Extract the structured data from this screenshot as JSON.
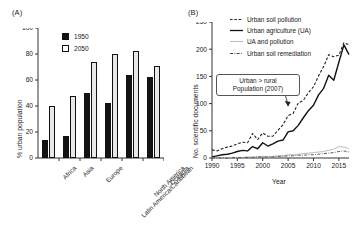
{
  "figure": {
    "panel_a_label": "(A)",
    "panel_b_label": "(B)"
  },
  "chart_data": [
    {
      "type": "bar",
      "panel": "(A)",
      "title": "",
      "xlabel": "",
      "ylabel": "% urban population",
      "ylim": [
        0,
        100
      ],
      "yticks": [
        0,
        20,
        40,
        60,
        80,
        100
      ],
      "grid": false,
      "legend_position": "top-left-inside",
      "categories": [
        "Africa",
        "Asia",
        "Europe",
        "Latin America/Caribbean",
        "North America",
        "Oceania"
      ],
      "series": [
        {
          "name": "1950",
          "color": "#131313",
          "values": [
            14,
            17,
            50,
            42,
            64,
            62
          ]
        },
        {
          "name": "2050",
          "color": "#e8e8e8",
          "values": [
            40,
            48,
            74,
            80,
            82,
            71
          ]
        }
      ]
    },
    {
      "type": "line",
      "panel": "(B)",
      "title": "",
      "xlabel": "Year",
      "ylabel": "No. scientific documents",
      "xlim": [
        1990,
        2017
      ],
      "ylim": [
        0,
        250
      ],
      "yticks": [
        0,
        50,
        100,
        150,
        200,
        250
      ],
      "xticks": [
        1990,
        1995,
        2000,
        2005,
        2010,
        2015
      ],
      "grid": false,
      "legend_position": "top-left-inside",
      "annotations": [
        {
          "line1": "Urban > rural",
          "line2": "Population (2007)",
          "points_to_year": 2005,
          "points_to_value": 95
        }
      ],
      "x": [
        1990,
        1991,
        1992,
        1993,
        1994,
        1995,
        1996,
        1997,
        1998,
        1999,
        2000,
        2001,
        2002,
        2003,
        2004,
        2005,
        2006,
        2007,
        2008,
        2009,
        2010,
        2011,
        2012,
        2013,
        2014,
        2015,
        2016,
        2017
      ],
      "series": [
        {
          "name": "Urban soil pollution",
          "style": "dashed",
          "color": "#222222",
          "values": [
            15,
            13,
            17,
            20,
            22,
            26,
            29,
            28,
            45,
            34,
            46,
            40,
            40,
            51,
            61,
            78,
            82,
            101,
            106,
            120,
            131,
            151,
            168,
            190,
            186,
            189,
            212,
            208
          ]
        },
        {
          "name": "Urban agriculture (UA)",
          "style": "solid",
          "color": "#111111",
          "values": [
            2,
            4,
            6,
            7,
            9,
            12,
            14,
            13,
            21,
            17,
            28,
            22,
            26,
            31,
            33,
            48,
            50,
            60,
            74,
            87,
            97,
            116,
            128,
            152,
            143,
            176,
            208,
            190
          ]
        },
        {
          "name": "UA and pollution",
          "style": "solid-light",
          "color": "#bdbdbd",
          "values": [
            0,
            0,
            0,
            1,
            1,
            1,
            1,
            2,
            2,
            2,
            3,
            2,
            3,
            4,
            4,
            6,
            6,
            7,
            8,
            9,
            10,
            11,
            12,
            14,
            16,
            21,
            20,
            17
          ]
        },
        {
          "name": "Urban soil remediation",
          "style": "dashdot",
          "color": "#444444",
          "values": [
            0,
            0,
            0,
            0,
            1,
            1,
            1,
            1,
            1,
            2,
            2,
            2,
            2,
            3,
            3,
            4,
            4,
            5,
            5,
            6,
            6,
            7,
            8,
            9,
            10,
            12,
            13,
            11
          ]
        }
      ]
    }
  ]
}
